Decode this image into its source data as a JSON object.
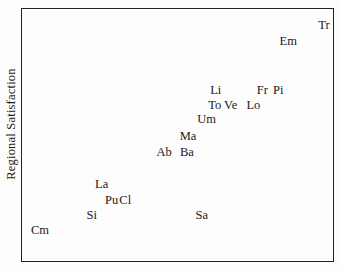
{
  "chart_data": {
    "type": "scatter",
    "marker_style": "text-label",
    "title": "",
    "xlabel": "",
    "ylabel": "Regional Satisfaction",
    "axis_ticks_visible": false,
    "grid": false,
    "legend": false,
    "xlim": [
      0,
      100
    ],
    "ylim": [
      0,
      100
    ],
    "points": [
      {
        "label": "Cm",
        "x": 5.8,
        "y": 12.2
      },
      {
        "label": "Si",
        "x": 22.4,
        "y": 18.1
      },
      {
        "label": "Sa",
        "x": 57.8,
        "y": 18.1
      },
      {
        "label": "Pu",
        "x": 28.8,
        "y": 24.4
      },
      {
        "label": "Cl",
        "x": 33.2,
        "y": 24.4
      },
      {
        "label": "La",
        "x": 25.6,
        "y": 30.7
      },
      {
        "label": "Ab",
        "x": 45.7,
        "y": 43.3
      },
      {
        "label": "Ba",
        "x": 53.0,
        "y": 43.3
      },
      {
        "label": "Ma",
        "x": 53.4,
        "y": 49.6
      },
      {
        "label": "Um",
        "x": 59.4,
        "y": 56.3
      },
      {
        "label": "To",
        "x": 62.0,
        "y": 61.8
      },
      {
        "label": "Ve",
        "x": 67.1,
        "y": 61.8
      },
      {
        "label": "Lo",
        "x": 74.4,
        "y": 61.8
      },
      {
        "label": "Li",
        "x": 62.3,
        "y": 67.7
      },
      {
        "label": "Fr",
        "x": 77.3,
        "y": 67.7
      },
      {
        "label": "Pi",
        "x": 82.4,
        "y": 67.7
      },
      {
        "label": "Em",
        "x": 85.6,
        "y": 87.4
      },
      {
        "label": "Tr",
        "x": 97.1,
        "y": 93.7
      }
    ],
    "colors": {
      "text": "#1a1a1a",
      "border": "#222222",
      "background": "#fdfdfd"
    }
  }
}
